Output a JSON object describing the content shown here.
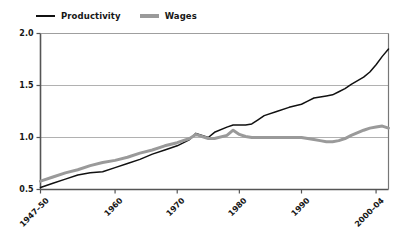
{
  "chart_data": {
    "type": "line",
    "title": "",
    "subtitle": "",
    "xlabel": "",
    "ylabel": "",
    "ylim": [
      0.5,
      2.0
    ],
    "yticks": [
      "0.5",
      "1.0",
      "1.5",
      "2.0"
    ],
    "ytick_values": [
      0.5,
      1.0,
      1.5,
      2.0
    ],
    "xticks": [
      "1947–50",
      "1960",
      "1970",
      "1980",
      "1990",
      "2000–04"
    ],
    "xtick_values": [
      1948,
      1960,
      1970,
      1980,
      1990,
      2002
    ],
    "xlim": [
      1948,
      2004
    ],
    "grid": "horizontal",
    "legend_position": "top-left",
    "colors": {
      "productivity": "#111111",
      "wages": "#9a9a9a",
      "grid": "#9d9d9d",
      "axis": "#4a4a4a",
      "background": "#ffffff"
    },
    "legend": [
      {
        "name": "Productivity",
        "color": "#111111",
        "width": 1.4
      },
      {
        "name": "Wages",
        "color": "#9a9a9a",
        "width": 3.2
      }
    ],
    "x": [
      1948,
      1950,
      1952,
      1954,
      1956,
      1958,
      1960,
      1962,
      1964,
      1966,
      1968,
      1970,
      1972,
      1973,
      1974,
      1975,
      1976,
      1978,
      1979,
      1980,
      1981,
      1982,
      1983,
      1984,
      1986,
      1988,
      1990,
      1991,
      1992,
      1993,
      1994,
      1995,
      1996,
      1997,
      1998,
      2000,
      2001,
      2002,
      2003,
      2004
    ],
    "series": [
      {
        "name": "Productivity",
        "color": "#111111",
        "values": [
          0.52,
          0.56,
          0.6,
          0.64,
          0.66,
          0.67,
          0.71,
          0.75,
          0.79,
          0.84,
          0.88,
          0.92,
          0.98,
          1.04,
          1.02,
          1.0,
          1.05,
          1.1,
          1.12,
          1.12,
          1.12,
          1.13,
          1.17,
          1.21,
          1.25,
          1.29,
          1.32,
          1.35,
          1.38,
          1.39,
          1.4,
          1.41,
          1.44,
          1.47,
          1.51,
          1.58,
          1.63,
          1.7,
          1.78,
          1.85
        ]
      },
      {
        "name": "Wages",
        "color": "#9a9a9a",
        "values": [
          0.58,
          0.62,
          0.66,
          0.69,
          0.73,
          0.76,
          0.78,
          0.81,
          0.85,
          0.88,
          0.92,
          0.95,
          0.99,
          1.03,
          1.01,
          0.99,
          0.99,
          1.02,
          1.07,
          1.03,
          1.01,
          1.0,
          1.0,
          1.0,
          1.0,
          1.0,
          1.0,
          0.99,
          0.98,
          0.97,
          0.96,
          0.96,
          0.97,
          0.99,
          1.02,
          1.07,
          1.09,
          1.1,
          1.11,
          1.09
        ]
      }
    ]
  },
  "legend_entries": [
    {
      "label": "Productivity"
    },
    {
      "label": "Wages"
    }
  ]
}
